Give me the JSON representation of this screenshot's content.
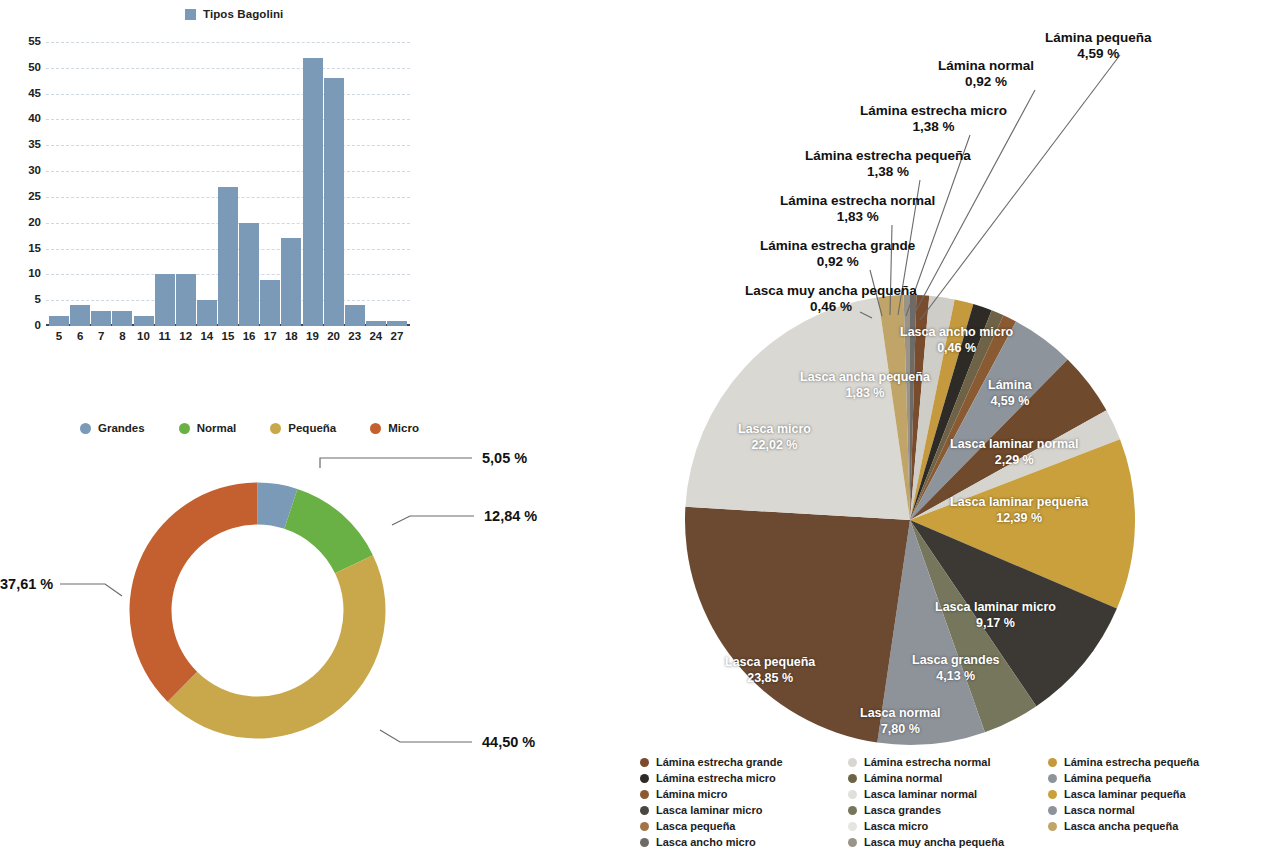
{
  "bar_chart": {
    "legend_label": "Tipos Bagolini",
    "legend_color": "#7b9ab8"
  },
  "donut_chart": {
    "legend": [
      {
        "label": "Grandes",
        "color": "#7b9ab8"
      },
      {
        "label": "Normal",
        "color": "#69b045"
      },
      {
        "label": "Pequeña",
        "color": "#c9a84c"
      },
      {
        "label": "Micro",
        "color": "#c4602f"
      }
    ],
    "callouts": {
      "grandes": "5,05 %",
      "normal": "12,84 %",
      "pequena": "44,50 %",
      "micro": "37,61 %"
    }
  },
  "pie_chart": {
    "outside_labels": [
      {
        "name": "Lámina pequeña",
        "value": "4,59 %"
      },
      {
        "name": "Lámina normal",
        "value": "0,92 %"
      },
      {
        "name": "Lámina estrecha micro",
        "value": "1,38 %"
      },
      {
        "name": "Lámina estrecha pequeña",
        "value": "1,38 %"
      },
      {
        "name": "Lámina estrecha normal",
        "value": "1,83 %"
      },
      {
        "name": "Lámina estrecha grande",
        "value": "0,92 %"
      },
      {
        "name": "Lasca muy ancha pequeña",
        "value": "0,46 %"
      }
    ],
    "inside_labels": [
      {
        "name": "Lasca ancho micro",
        "value": "0,46 %"
      },
      {
        "name": "Lasca ancha pequeña",
        "value": "1,83 %"
      },
      {
        "name": "Lasca micro",
        "value": "22,02 %"
      },
      {
        "name": "Lámina",
        "value": "4,59 %"
      },
      {
        "name": "Lasca laminar normal",
        "value": "2,29 %"
      },
      {
        "name": "Lasca laminar pequeña",
        "value": "12,39 %"
      },
      {
        "name": "Lasca laminar micro",
        "value": "9,17 %"
      },
      {
        "name": "Lasca grandes",
        "value": "4,13 %"
      },
      {
        "name": "Lasca normal",
        "value": "7,80 %"
      },
      {
        "name": "Lasca pequeña",
        "value": "23,85 %"
      }
    ],
    "legend_columns": [
      [
        {
          "label": "Lámina estrecha grande",
          "color": "#7a4c2e"
        },
        {
          "label": "Lámina estrecha micro",
          "color": "#2e2a26"
        },
        {
          "label": "Lámina micro",
          "color": "#8a5a32"
        },
        {
          "label": "Lasca laminar micro",
          "color": "#4a4741"
        },
        {
          "label": "Lasca pequeña",
          "color": "#a07549"
        },
        {
          "label": "Lasca ancho micro",
          "color": "#6e6b66"
        }
      ],
      [
        {
          "label": "Lámina estrecha normal",
          "color": "#d8d6d1"
        },
        {
          "label": "Lámina normal",
          "color": "#6e6347"
        },
        {
          "label": "Lasca laminar normal",
          "color": "#e0dfdb"
        },
        {
          "label": "Lasca grandes",
          "color": "#76765c"
        },
        {
          "label": "Lasca micro",
          "color": "#e6e5e1"
        },
        {
          "label": "Lasca muy ancha pequeña",
          "color": "#9a9488"
        }
      ],
      [
        {
          "label": "Lámina estrecha pequeña",
          "color": "#c59a3f"
        },
        {
          "label": "Lámina pequeña",
          "color": "#8d949c"
        },
        {
          "label": "Lasca laminar pequeña",
          "color": "#c9a03c"
        },
        {
          "label": "Lasca normal",
          "color": "#8e939a"
        },
        {
          "label": "Lasca ancha pequeña",
          "color": "#c0a468"
        }
      ]
    ]
  },
  "chart_data": [
    {
      "type": "bar",
      "title": "Tipos Bagolini",
      "xlabel": "",
      "ylabel": "",
      "ylim": [
        0,
        55
      ],
      "ytick_step": 5,
      "yticks": [
        0,
        5,
        10,
        15,
        20,
        25,
        30,
        35,
        40,
        45,
        50,
        55
      ],
      "grid": true,
      "legend": [
        "Tipos Bagolini"
      ],
      "legend_position": "top",
      "categories": [
        "5",
        "6",
        "7",
        "8",
        "10",
        "11",
        "12",
        "14",
        "15",
        "16",
        "17",
        "18",
        "19",
        "20",
        "23",
        "24",
        "27"
      ],
      "values": [
        2,
        4,
        3,
        3,
        2,
        10,
        10,
        5,
        27,
        20,
        9,
        17,
        52,
        48,
        4,
        1,
        1
      ],
      "series": [
        {
          "name": "Tipos Bagolini",
          "color": "#7b9ab8",
          "values": [
            2,
            4,
            3,
            3,
            2,
            10,
            10,
            5,
            27,
            20,
            9,
            17,
            52,
            48,
            4,
            1,
            1
          ]
        }
      ]
    },
    {
      "type": "pie",
      "title": "",
      "donut": true,
      "legend_position": "top",
      "labels": [
        "Grandes",
        "Normal",
        "Pequeña",
        "Micro"
      ],
      "values": [
        5.05,
        12.84,
        44.5,
        37.61
      ],
      "value_labels": [
        "5,05 %",
        "12,84 %",
        "44,50 %",
        "37,61 %"
      ],
      "colors": [
        "#7b9ab8",
        "#69b045",
        "#c9a84c",
        "#c4602f"
      ]
    },
    {
      "type": "pie",
      "title": "",
      "donut": false,
      "legend_position": "bottom",
      "labels": [
        "Lámina pequeña",
        "Lámina normal",
        "Lámina estrecha micro",
        "Lámina estrecha pequeña",
        "Lámina estrecha normal",
        "Lámina estrecha grande",
        "Lasca muy ancha pequeña",
        "Lasca ancho micro",
        "Lasca ancha pequeña",
        "Lasca micro",
        "Lasca pequeña",
        "Lasca normal",
        "Lasca grandes",
        "Lasca laminar micro",
        "Lasca laminar pequeña",
        "Lasca laminar normal",
        "Lámina"
      ],
      "values": [
        4.59,
        0.92,
        1.38,
        1.38,
        1.83,
        0.92,
        0.46,
        0.46,
        1.83,
        22.02,
        23.85,
        7.8,
        4.13,
        9.17,
        12.39,
        2.29,
        4.59
      ],
      "value_labels": [
        "4,59 %",
        "0,92 %",
        "1,38 %",
        "1,38 %",
        "1,83 %",
        "0,92 %",
        "0,46 %",
        "0,46 %",
        "1,83 %",
        "22,02 %",
        "23,85 %",
        "7,80 %",
        "4,13 %",
        "9,17 %",
        "12,39 %",
        "2,29 %",
        "4,59 %"
      ]
    }
  ]
}
